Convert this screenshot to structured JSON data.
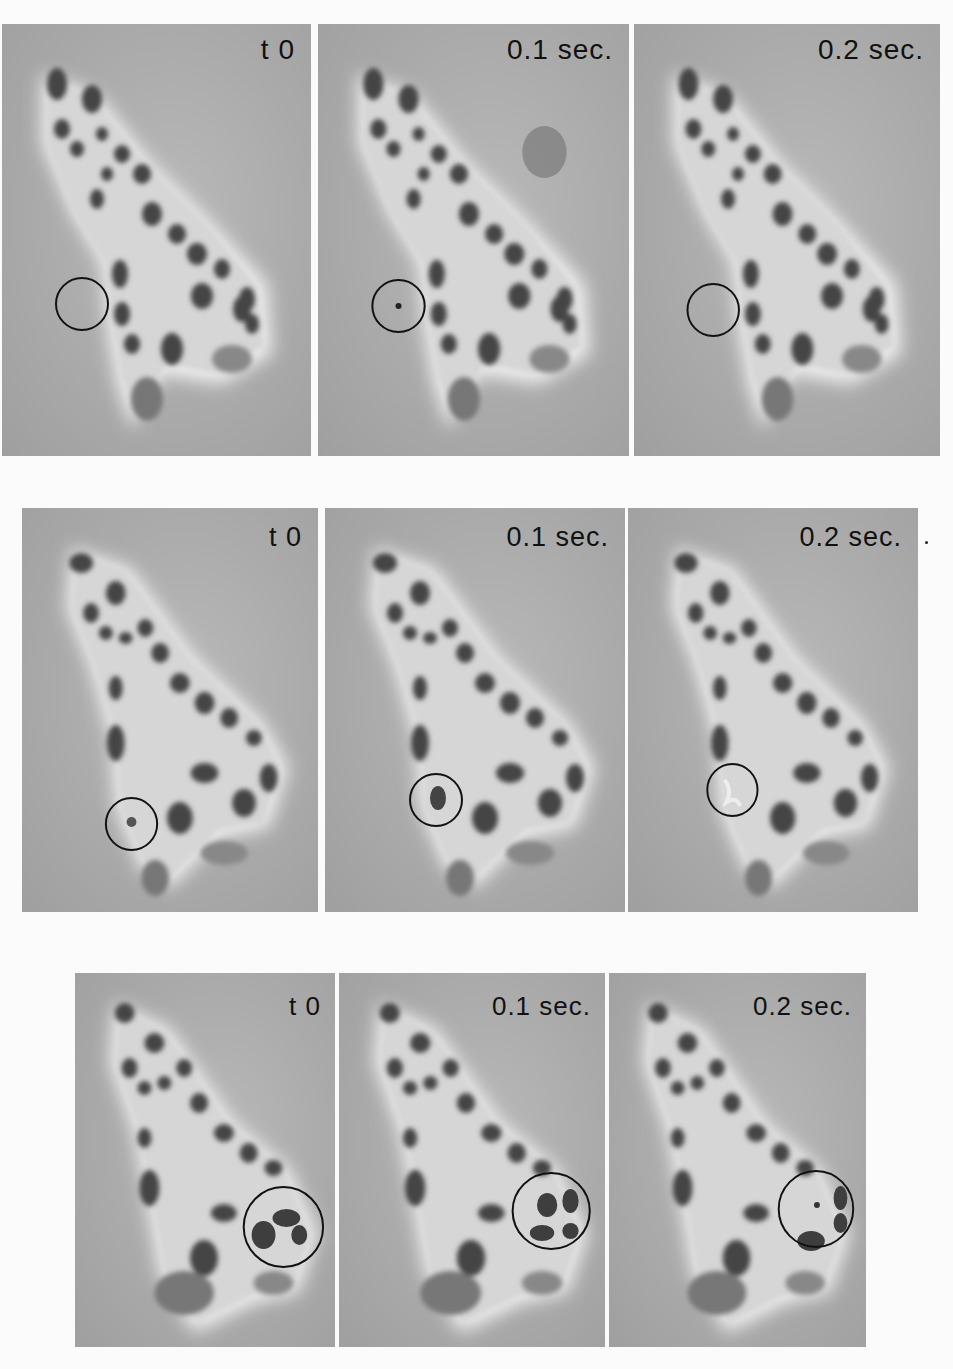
{
  "figure": {
    "rows": [
      {
        "panels": [
          {
            "label": "t 0",
            "circle": {
              "cx": 160,
              "cy": 280,
              "r": 26
            }
          },
          {
            "label": "0.1 sec.",
            "circle": {
              "cx": 150,
              "cy": 282,
              "r": 26
            },
            "extra_blob": true
          },
          {
            "label": "0.2 sec.",
            "circle": {
              "cx": 150,
              "cy": 286,
              "r": 26
            }
          }
        ]
      },
      {
        "panels": [
          {
            "label": "t 0",
            "circle": {
              "cx": 111,
              "cy": 316,
              "r": 26
            }
          },
          {
            "label": "0.1 sec.",
            "circle": {
              "cx": 111,
              "cy": 292,
              "r": 26
            }
          },
          {
            "label": "0.2 sec.",
            "circle": {
              "cx": 108,
              "cy": 282,
              "r": 26
            },
            "trailing_mark": "·"
          }
        ]
      },
      {
        "panels": [
          {
            "label": "t 0",
            "circle": {
              "cx": 210,
              "cy": 254,
              "r": 40
            }
          },
          {
            "label": "0.1 sec.",
            "circle": {
              "cx": 209,
              "cy": 238,
              "r": 38
            }
          },
          {
            "label": "0.2 sec.",
            "circle": {
              "cx": 211,
              "cy": 236,
              "r": 38
            }
          }
        ]
      }
    ]
  },
  "colors": {
    "page_background": "#fbfbfb",
    "panel_background": "#a9a9a9",
    "cell_body": "#d8d8d8",
    "organelle": "#4a4a4a",
    "circle_marker": "#111111",
    "label_text": "#111111"
  }
}
